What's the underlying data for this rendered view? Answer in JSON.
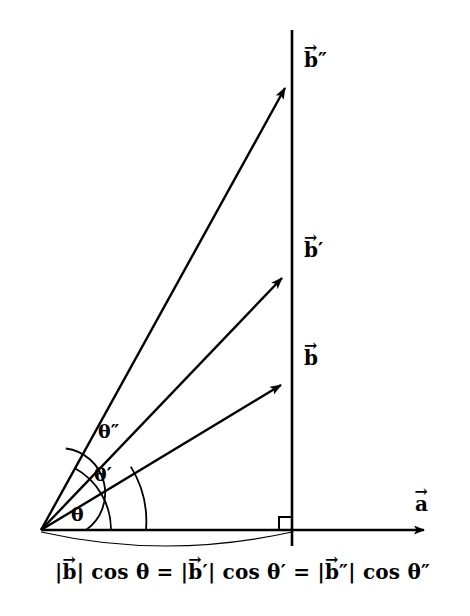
{
  "figure": {
    "type": "vector-projection-diagram",
    "background_color": "#ffffff",
    "stroke_color": "#000000"
  },
  "axis": {
    "a_label_letter": "a",
    "a_label_accent": "→",
    "a_label_full": "a⃗",
    "origin": {
      "x": 41,
      "y": 530
    },
    "tip": {
      "x": 432,
      "y": 530
    }
  },
  "projection_line": {
    "name": "vertical-projection-line",
    "x": 292,
    "y_top": 30,
    "y_bottom": 546
  },
  "right_angle": {
    "present": true,
    "size": 13
  },
  "vectors": [
    {
      "id": "b",
      "label_letter": "b",
      "label_primes": "",
      "label_full": "b⃗",
      "label_x": 304,
      "label_y": 346,
      "tip": {
        "x": 292,
        "y": 380
      }
    },
    {
      "id": "b-prime",
      "label_letter": "b",
      "label_primes": "′",
      "label_full": "b⃗′",
      "label_x": 304,
      "label_y": 238,
      "tip": {
        "x": 292,
        "y": 272
      }
    },
    {
      "id": "b-double-prime",
      "label_letter": "b",
      "label_primes": "″",
      "label_full": "b⃗″",
      "label_x": 304,
      "label_y": 48,
      "tip": {
        "x": 292,
        "y": 81
      }
    }
  ],
  "angles": [
    {
      "id": "theta",
      "label": "θ",
      "symbol": "θ",
      "primes": "",
      "label_x": 71,
      "label_y": 503,
      "arc_radius": 105,
      "between": [
        "a",
        "b"
      ]
    },
    {
      "id": "theta-prime",
      "label": "θ′",
      "symbol": "θ",
      "primes": "′",
      "label_x": 94,
      "label_y": 463,
      "arc_radius": 70,
      "between": [
        "a",
        "b-prime"
      ]
    },
    {
      "id": "theta-double-prime",
      "label": "θ″",
      "symbol": "θ",
      "primes": "″",
      "label_x": 98,
      "label_y": 420,
      "arc_radius": 45,
      "between": [
        "a",
        "b-double-prime"
      ]
    }
  ],
  "brace": {
    "name": "projection-span-arc",
    "from_x": 41,
    "to_x": 292,
    "y": 532,
    "sag": 14
  },
  "equation": {
    "text": "|b⃗| cos θ = |b⃗′| cos θ′ = |b⃗″| cos θ″",
    "terms": [
      {
        "magnitude": "|b⃗|",
        "trig": "cos",
        "angle": "θ"
      },
      {
        "magnitude": "|b⃗′|",
        "trig": "cos",
        "angle": "θ′"
      },
      {
        "magnitude": "|b⃗″|",
        "trig": "cos",
        "angle": "θ″"
      }
    ],
    "relation": "=",
    "x": 55,
    "y": 560
  }
}
